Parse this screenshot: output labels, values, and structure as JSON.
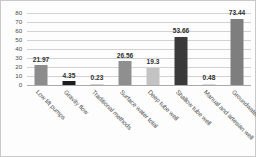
{
  "chart_data": {
    "type": "bar",
    "title": "",
    "subtitle": "",
    "xlabel": "",
    "ylabel": "",
    "ylim": [
      0,
      80
    ],
    "yticks": [
      80,
      70,
      60,
      50,
      40,
      30,
      20,
      10,
      0
    ],
    "grid": true,
    "legend": "none",
    "categories": [
      "Low lift pumps",
      "Gravity flow",
      "Traditional methods",
      "Surface water total",
      "Deep tube well",
      "Shallow tube well",
      "Manual and artesian well",
      "Groundwater total"
    ],
    "values": [
      21.97,
      4.35,
      0.23,
      26.56,
      19.3,
      53.66,
      0.48,
      73.44
    ],
    "value_labels": [
      "21.97",
      "4.35",
      "0.23",
      "26.56",
      "19.3",
      "53.66",
      "0.48",
      "73.44"
    ],
    "bar_colors": [
      "#8c8c8c",
      "#1c1c1c",
      "#cfcfcf",
      "#8f8f8f",
      "#c3c3c3",
      "#3a3a3a",
      "#d8d8d8",
      "#7e7e7e"
    ]
  },
  "style": {
    "grid_color": "#d2d2d2",
    "axis_color": "#aaaaaa",
    "border_color": "#c9c9c9",
    "background": "#fdfdfd",
    "text_color": "#4a4a4a"
  }
}
